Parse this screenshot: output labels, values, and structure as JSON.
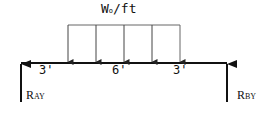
{
  "diagram": {
    "type": "simply-supported-beam-free-body",
    "load": {
      "label_main": "W",
      "label_sub": "o",
      "label_unit": "/ft",
      "type": "uniformly distributed",
      "arrow_count": 5
    },
    "dimensions": [
      {
        "label": "3'"
      },
      {
        "label": "6'"
      },
      {
        "label": "3'"
      }
    ],
    "reactions": [
      {
        "main": "R",
        "sub": "AY"
      },
      {
        "main": "R",
        "sub": "BY"
      }
    ],
    "colors": {
      "line": "#111111",
      "load_line": "#555555",
      "background": "#ffffff"
    }
  }
}
